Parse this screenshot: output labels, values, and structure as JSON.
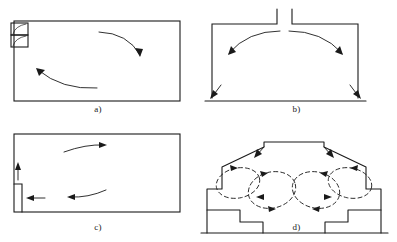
{
  "figure": {
    "background_color": "#ffffff",
    "stroke_color": "#1a1a1a",
    "panel_count": 4
  },
  "panels": [
    {
      "id": "a",
      "caption": "a)",
      "description": "Rectangular room with stacked supply/return registers at upper-left wall; two curved airflow arrows forming a large recirculation loop",
      "enclosure_shape": "rectangle",
      "inlet_position": "upper-left-wall",
      "inlet_type": "stacked-twin-register",
      "arrows": [
        {
          "name": "upper-jet-arrow",
          "path": "curved",
          "direction": "down-right",
          "style": "solid"
        },
        {
          "name": "lower-return-arrow",
          "path": "curved",
          "direction": "up-left",
          "style": "solid"
        }
      ]
    },
    {
      "id": "b",
      "caption": "b)",
      "description": "Rectangular room with a central ceiling slot inlet; symmetric twin curved jets spreading outward and down along both side walls to the floor corners",
      "enclosure_shape": "rectangle-with-ceiling-slot",
      "inlet_position": "ceiling-center",
      "inlet_type": "slot-diffuser",
      "arrows": [
        {
          "name": "left-ceiling-jet-arrow",
          "path": "curved",
          "direction": "left-down",
          "style": "solid"
        },
        {
          "name": "right-ceiling-jet-arrow",
          "path": "curved",
          "direction": "right-down",
          "style": "solid"
        },
        {
          "name": "left-floor-corner-arrow",
          "path": "straight",
          "direction": "down-left",
          "style": "solid"
        },
        {
          "name": "right-floor-corner-arrow",
          "path": "straight",
          "direction": "down-right",
          "style": "solid"
        }
      ]
    },
    {
      "id": "c",
      "caption": "c)",
      "description": "Rectangular room with a low sidewall inlet on the left and an exhaust above it; a large clockwise recirculation loop fills the room",
      "enclosure_shape": "rectangle",
      "inlet_position": "lower-left-wall",
      "inlet_type": "low-sidewall-grille",
      "arrows": [
        {
          "name": "exhaust-up-arrow",
          "path": "straight",
          "direction": "up",
          "style": "solid"
        },
        {
          "name": "supply-in-arrow",
          "path": "straight",
          "direction": "left",
          "style": "solid"
        },
        {
          "name": "upper-flow-arrow",
          "path": "curved",
          "direction": "right",
          "style": "solid"
        },
        {
          "name": "lower-return-arrow",
          "path": "curved",
          "direction": "left",
          "style": "solid"
        }
      ]
    },
    {
      "id": "d",
      "caption": "d)",
      "description": "Symmetric stepped hall section with raised central roof monitor; downward inlet jets at the monitor shoulders feed two pairs of counter-rotating vortices over the stepped seating on each side",
      "enclosure_shape": "stepped-symmetric-hall",
      "inlet_position": "roof-monitor-shoulders",
      "inlet_type": "downward-supply-nozzles",
      "arrows": [
        {
          "name": "left-inlet-arrow",
          "path": "straight",
          "direction": "down-left",
          "style": "solid"
        },
        {
          "name": "right-inlet-arrow",
          "path": "straight",
          "direction": "down-right",
          "style": "solid"
        },
        {
          "name": "left-outer-vortex",
          "path": "closed-loop",
          "direction": "clockwise",
          "style": "dashed"
        },
        {
          "name": "left-inner-vortex",
          "path": "closed-loop",
          "direction": "clockwise",
          "style": "dashed"
        },
        {
          "name": "right-inner-vortex",
          "path": "closed-loop",
          "direction": "counter-clockwise",
          "style": "dashed"
        },
        {
          "name": "right-outer-vortex",
          "path": "closed-loop",
          "direction": "counter-clockwise",
          "style": "dashed"
        }
      ]
    }
  ]
}
